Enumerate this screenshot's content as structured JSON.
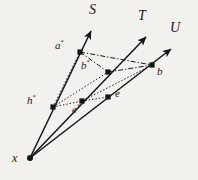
{
  "figure": {
    "background_color": "#f3f1ee",
    "ink_color": "#151515",
    "canvas": {
      "width": 198,
      "height": 180
    }
  },
  "labels": {
    "ray_S": "S",
    "ray_T": "T",
    "ray_U": "U",
    "point_a_star_base": "a",
    "point_a_star_mark": "*",
    "point_b_star_base": "b",
    "point_b_star_mark": "*",
    "point_h_star_base": "h",
    "point_h_star_mark": "*",
    "point_e_star_base": "e",
    "point_e_star_mark": "*",
    "point_e": "e",
    "point_b": "b",
    "origin_x": "x"
  },
  "geometry": {
    "origin": {
      "x": 30,
      "y": 158
    },
    "rays": [
      {
        "name": "S",
        "tip": {
          "x": 93,
          "y": 28
        },
        "label_pos": {
          "x": 93,
          "y": 10
        }
      },
      {
        "name": "T",
        "tip": {
          "x": 148,
          "y": 34
        },
        "label_pos": {
          "x": 141,
          "y": 16
        }
      },
      {
        "name": "U",
        "tip": {
          "x": 173,
          "y": 46
        },
        "label_pos": {
          "x": 172,
          "y": 28
        }
      }
    ],
    "points": [
      {
        "name": "a*",
        "x": 80,
        "y": 52,
        "label_pos": {
          "x": 56,
          "y": 44
        }
      },
      {
        "name": "b*",
        "x": 108,
        "y": 72,
        "label_pos": {
          "x": 82,
          "y": 64
        }
      },
      {
        "name": "b",
        "x": 152,
        "y": 65,
        "label_pos": {
          "x": 157,
          "y": 70
        }
      },
      {
        "name": "h*",
        "x": 53,
        "y": 107,
        "label_pos": {
          "x": 28,
          "y": 99
        }
      },
      {
        "name": "e*",
        "x": 82,
        "y": 101,
        "label_pos": {
          "x": 73,
          "y": 107
        }
      },
      {
        "name": "e",
        "x": 108,
        "y": 97,
        "label_pos": {
          "x": 115,
          "y": 93
        }
      }
    ],
    "dashdot_edges": [
      {
        "from": "a*",
        "to": "b*"
      },
      {
        "from": "a*",
        "to": "b"
      },
      {
        "from": "b*",
        "to": "b"
      }
    ],
    "dotted_edges": [
      {
        "from": "h*",
        "to": "b*"
      },
      {
        "from": "h*",
        "to": "e*"
      },
      {
        "from": "e*",
        "to": "e"
      },
      {
        "from": "e*",
        "to": "b"
      },
      {
        "from": "h*",
        "to": "a*"
      }
    ]
  }
}
